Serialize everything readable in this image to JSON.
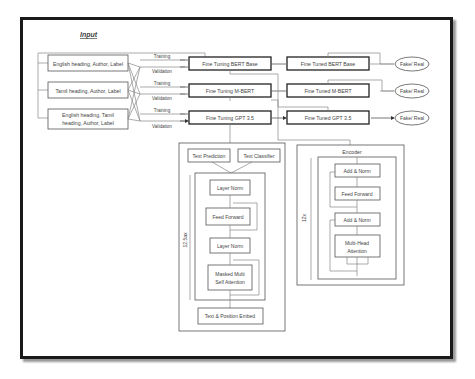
{
  "title": "Input",
  "inputs": [
    {
      "lines": [
        "English heading, Author, Label"
      ]
    },
    {
      "lines": [
        "Tamil heading, Author, Label"
      ]
    },
    {
      "lines": [
        "English heading, Tamil",
        "heading, Author, Label"
      ]
    }
  ],
  "edge_labels": {
    "training": "Training",
    "validation": "Validation"
  },
  "fine_tuning": [
    "Fine Tuning BERT Base",
    "Fine Tuning M-BERT",
    "Fine Tuning GPT 3.5"
  ],
  "fine_tuned": [
    "Fine Tuned BERT Base",
    "Fine Tuned M-BERT",
    "Fine Tuned GPT 3.5"
  ],
  "outputs": [
    "Fake/ Real",
    "Fake/ Real",
    "Fake/ Real"
  ],
  "gpt_block": {
    "heads": [
      "Text Prediction",
      "Text Classifier"
    ],
    "layers": [
      "Layer Norm",
      "Feed Forward",
      "Layer Norm"
    ],
    "attention": [
      "Masked Multi",
      "Self Attention"
    ],
    "embed": "Text & Position Embed",
    "repeat": "12.5ax"
  },
  "encoder_block": {
    "title": "Encoder",
    "layers": [
      "Add & Norm",
      "Feed Forward",
      "Add & Norm"
    ],
    "attention": [
      "Multi-Head",
      "Attention"
    ],
    "repeat": "12x"
  }
}
